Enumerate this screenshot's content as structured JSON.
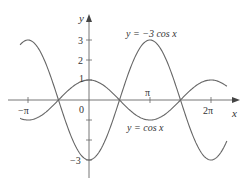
{
  "chart_data": {
    "type": "line",
    "title": "",
    "xlabel": "x",
    "ylabel": "y",
    "xlim": [
      -3.55,
      7.1
    ],
    "ylim": [
      -3.4,
      4.3
    ],
    "grid": false,
    "x_ticks": [
      {
        "value": -3.14159,
        "label": "−π"
      },
      {
        "value": 3.14159,
        "label": "π"
      },
      {
        "value": 6.28319,
        "label": "2π"
      }
    ],
    "y_ticks": [
      {
        "value": 3,
        "label": "3"
      },
      {
        "value": 2,
        "label": "2"
      },
      {
        "value": 1,
        "label": "1"
      },
      {
        "value": -1,
        "label": ""
      },
      {
        "value": -2,
        "label": ""
      },
      {
        "value": -3,
        "label": "−3"
      }
    ],
    "origin_label": "0",
    "series": [
      {
        "name": "y = cos x",
        "function": "cos(x)",
        "amplitude": 1,
        "x_range": [
          -3.55,
          7.1
        ],
        "color": "#555555"
      },
      {
        "name": "y = −3 cos x",
        "function": "-3*cos(x)",
        "amplitude": -3,
        "x_range": [
          -3.55,
          7.1
        ],
        "color": "#555555"
      }
    ],
    "annotations": [
      {
        "text": "y = −3 cos x",
        "near_series": "y = −3 cos x",
        "position": "above peak at x=π"
      },
      {
        "text": "y = cos x",
        "near_series": "y = cos x",
        "position": "below trough at x=π"
      }
    ]
  },
  "labels": {
    "y_axis": "y",
    "x_axis": "x",
    "origin": "0",
    "neg_pi": "−π",
    "pi": "π",
    "two_pi": "2π",
    "y3": "3",
    "y2": "2",
    "y1": "1",
    "yneg3": "−3",
    "curve_neg3cos": "y = −3 cos x",
    "curve_cos": "y = cos x"
  }
}
